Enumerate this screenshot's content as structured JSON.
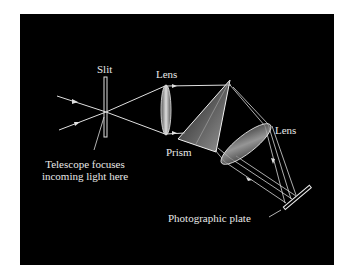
{
  "diagram": {
    "type": "spectrograph-schematic",
    "background_color": "#000000",
    "line_color": "#e0e0e0",
    "labels": {
      "slit": "Slit",
      "lens1": "Lens",
      "prism": "Prism",
      "lens2": "Lens",
      "telescope_line1": "Telescope focuses",
      "telescope_line2": "incoming light here",
      "plate": "Photographic plate"
    },
    "components": [
      "slit",
      "collimating-lens",
      "prism",
      "camera-lens",
      "photographic-plate"
    ]
  }
}
